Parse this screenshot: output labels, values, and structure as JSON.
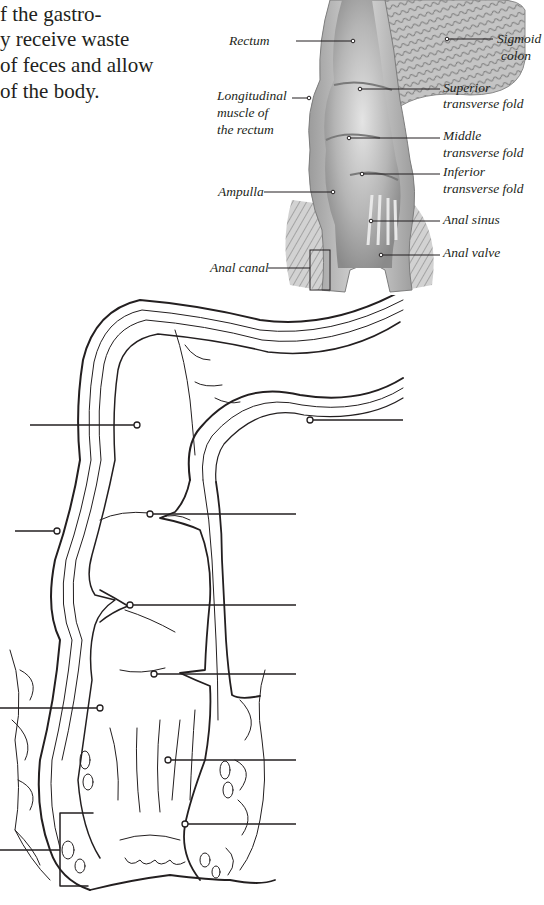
{
  "intro_text": {
    "lines": [
      "f the gastro-",
      "y receive waste",
      "of feces and allow",
      "of the body."
    ]
  },
  "reference_figure": {
    "labels": {
      "rectum": "Rectum",
      "sigmoid_colon_1": "Sigmoid",
      "sigmoid_colon_2": "colon",
      "longitudinal_1": "Longitudinal",
      "longitudinal_2": "muscle of",
      "longitudinal_3": "the rectum",
      "superior_1": "Superior",
      "superior_2": "transverse fold",
      "middle_1": "Middle",
      "middle_2": "transverse fold",
      "inferior_1": "Inferior",
      "inferior_2": "transverse fold",
      "ampulla": "Ampulla",
      "anal_sinus": "Anal sinus",
      "anal_valve": "Anal valve",
      "anal_canal": "Anal canal"
    },
    "colors": {
      "tissue_light": "#d9d9d9",
      "tissue_mid": "#a8a8a8",
      "tissue_dark": "#6d6d6d",
      "ink": "#231f20"
    }
  },
  "quiz_figure": {
    "blank_labels_count": 10,
    "leaders": [
      {
        "target": "rectum",
        "side": "left"
      },
      {
        "target": "sigmoid-colon",
        "side": "right"
      },
      {
        "target": "longitudinal-muscle",
        "side": "left"
      },
      {
        "target": "superior-transverse-fold",
        "side": "right"
      },
      {
        "target": "middle-transverse-fold",
        "side": "right"
      },
      {
        "target": "inferior-transverse-fold",
        "side": "right"
      },
      {
        "target": "ampulla",
        "side": "left"
      },
      {
        "target": "anal-sinus",
        "side": "right"
      },
      {
        "target": "anal-valve",
        "side": "right"
      },
      {
        "target": "anal-canal",
        "side": "left"
      }
    ]
  }
}
